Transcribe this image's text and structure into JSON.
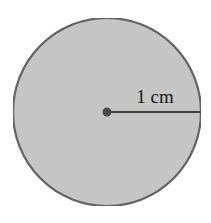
{
  "diagram": {
    "type": "circle-with-radius",
    "radius_label": "1 cm",
    "circle": {
      "cx": 107,
      "cy": 112,
      "r": 94,
      "fill": "#c6c6c6",
      "stroke": "#5a5a5a"
    },
    "center_dot": {
      "r": 4.5,
      "fill": "#4a4a4a"
    },
    "radius_line": {
      "x2": 201,
      "stroke": "#3e3e3e"
    },
    "label_position": {
      "x": 155,
      "y": 103
    }
  }
}
